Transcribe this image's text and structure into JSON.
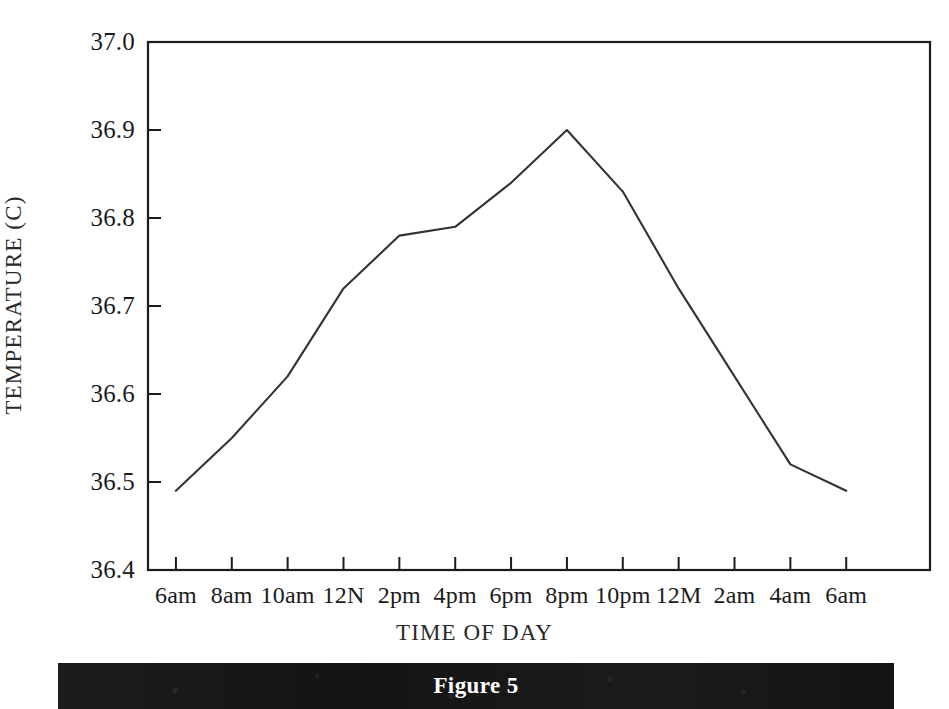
{
  "figure": {
    "caption": "Figure 5"
  },
  "chart_data": {
    "type": "line",
    "title": "",
    "xlabel": "TIME OF DAY",
    "ylabel": "TEMPERATURE (C)",
    "categories": [
      "6am",
      "8am",
      "10am",
      "12N",
      "2pm",
      "4pm",
      "6pm",
      "8pm",
      "10pm",
      "12M",
      "2am",
      "4am",
      "6am"
    ],
    "values": [
      36.49,
      36.55,
      36.62,
      36.72,
      36.78,
      36.79,
      36.84,
      36.9,
      36.83,
      36.72,
      36.62,
      36.52,
      36.49
    ],
    "ylim": [
      36.4,
      37.0
    ],
    "yticks": [
      "36.4",
      "36.5",
      "36.6",
      "36.7",
      "36.8",
      "36.9",
      "37.0"
    ],
    "ytick_values": [
      36.4,
      36.5,
      36.6,
      36.7,
      36.8,
      36.9,
      37.0
    ],
    "grid": false,
    "legend": null,
    "line_color": "#333333",
    "series_name": "Body temperature"
  }
}
